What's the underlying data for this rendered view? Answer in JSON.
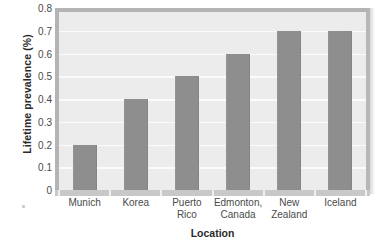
{
  "chart_data": {
    "type": "bar",
    "title": "",
    "xlabel": "Location",
    "ylabel": "Lifetime prevalence (%)",
    "categories": [
      "Munich",
      "Korea",
      "Puerto\nRico",
      "Edmonton,\nCanada",
      "New\nZealand",
      "Iceland"
    ],
    "values": [
      0.2,
      0.4,
      0.5,
      0.6,
      0.7,
      0.7
    ],
    "ylim": [
      0,
      0.8
    ],
    "yticks": [
      "0.8",
      "0.7",
      "0.6",
      "0.5",
      "0.4",
      "0.3",
      "0.2",
      "0.1",
      "0"
    ],
    "ytick_values": [
      0.8,
      0.7,
      0.6,
      0.5,
      0.4,
      0.3,
      0.2,
      0.1,
      0
    ],
    "grid": true,
    "legend": "none",
    "colors": {
      "bar": "#8e8e8e",
      "plot_background": "#ececec",
      "gridline": "#fbfbfb",
      "frame": "#b4b4b4",
      "baseline": "#c8c8c8",
      "text": "#4a4a4a",
      "title_text": "#2b2b2b"
    }
  }
}
